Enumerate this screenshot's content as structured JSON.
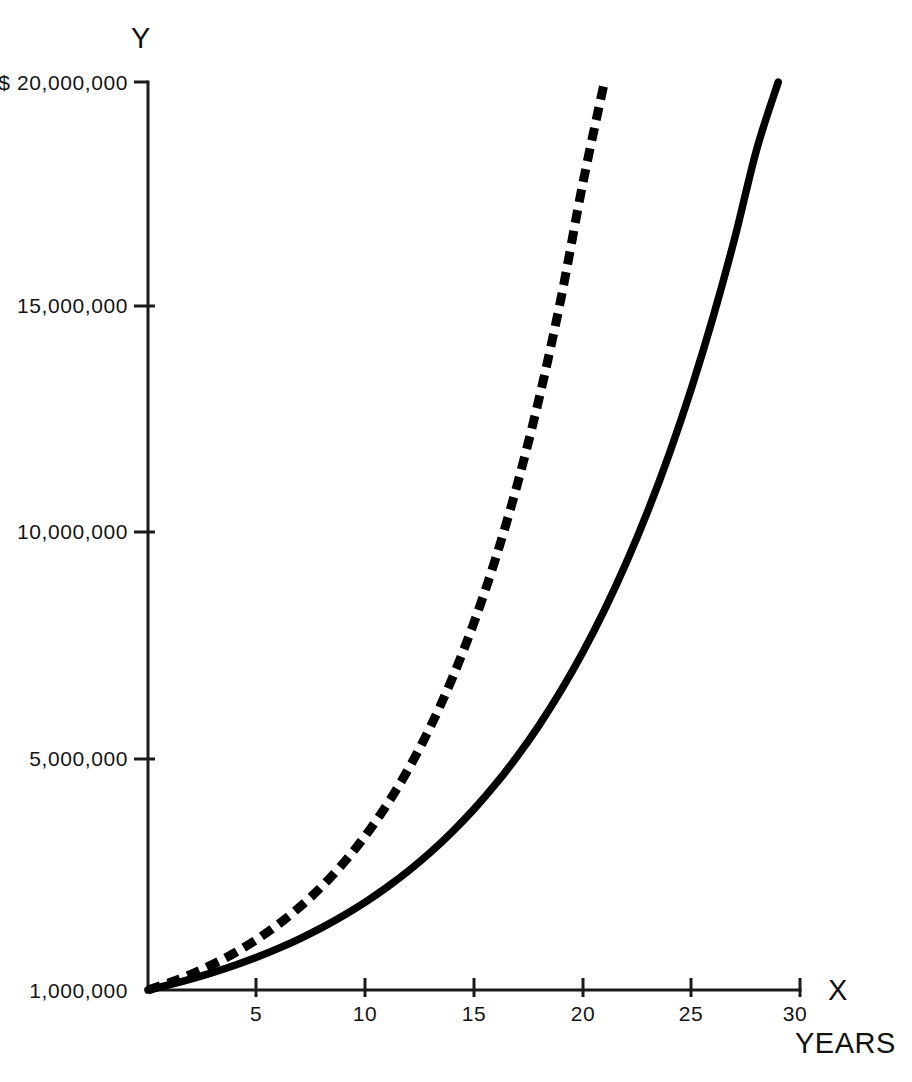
{
  "chart_data": {
    "type": "line",
    "title": "",
    "subtitle": "",
    "xlabel": "X",
    "xlabel_caption": "YEARS",
    "ylabel": "Y",
    "currency_prefix": "$",
    "grid": false,
    "legend": "none",
    "xlim": [
      0,
      30
    ],
    "ylim": [
      1000000,
      20000000
    ],
    "x_ticks": [
      5,
      10,
      15,
      20,
      25,
      30
    ],
    "x_tick_labels": [
      "5",
      "10",
      "15",
      "20",
      "25",
      "30"
    ],
    "y_ticks": [
      1000000,
      5000000,
      10000000,
      15000000,
      20000000
    ],
    "y_tick_labels": [
      "1,000,000",
      "5,000,000",
      "10,000,000",
      "15,000,000",
      "$ 20,000,000"
    ],
    "axis_origin_value": "1,000,000",
    "series": [
      {
        "name": "dashed-growth-curve",
        "style": "dashed",
        "color": "#000000",
        "x": [
          0,
          1,
          2,
          3,
          4,
          5,
          6,
          7,
          8,
          9,
          10,
          11,
          12,
          13,
          14,
          15,
          16,
          17,
          18,
          19,
          20,
          21,
          22,
          23,
          24,
          25,
          26,
          27
        ],
        "values": [
          1000000,
          1155000,
          1334000,
          1541000,
          1780000,
          2056000,
          2375000,
          2743000,
          3168000,
          3660000,
          4227000,
          4882000,
          5639000,
          6513000,
          7523000,
          8689000,
          10036000,
          11592000,
          13389000,
          15465000,
          17863000,
          20000000,
          20000000,
          20000000,
          20000000,
          20000000,
          20000000,
          20000000
        ]
      },
      {
        "name": "solid-growth-curve",
        "style": "solid",
        "color": "#000000",
        "x": [
          0,
          1,
          2,
          3,
          4,
          5,
          6,
          7,
          8,
          9,
          10,
          11,
          12,
          13,
          14,
          15,
          16,
          17,
          18,
          19,
          20,
          21,
          22,
          23,
          24,
          25,
          26,
          27,
          28,
          29,
          30
        ],
        "values": [
          1000000,
          1110000,
          1232000,
          1368000,
          1518000,
          1685000,
          1870000,
          2076000,
          2304000,
          2558000,
          2839000,
          3152000,
          3498000,
          3883000,
          4310000,
          4785000,
          5311000,
          5895000,
          6544000,
          7263000,
          8062000,
          8949000,
          9934000,
          11026000,
          12239000,
          13585000,
          15080000,
          16738000,
          18579000,
          20000000,
          20000000
        ]
      }
    ],
    "series_endpoints": {
      "dashed_end_year": 27,
      "solid_end_year": 30,
      "end_value": 20000000
    },
    "annotations": []
  },
  "layout": {
    "plot_left_px": 148,
    "plot_bottom_px": 990,
    "plot_top_px": 82,
    "plot_right_px": 800
  }
}
